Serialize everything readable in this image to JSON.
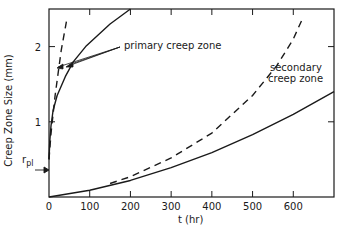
{
  "chart_data": {
    "type": "line",
    "title": "",
    "xlabel": "t (hr)",
    "ylabel": "Creep Zone Size (mm)",
    "xlim": [
      0,
      700
    ],
    "ylim": [
      0,
      2.5
    ],
    "x_ticks": [
      0,
      100,
      200,
      300,
      400,
      500,
      600
    ],
    "y_ticks": [
      1,
      2
    ],
    "grid": false,
    "annotations": [
      {
        "text": "primary creep zone",
        "x": 300,
        "y": 2.05
      },
      {
        "text": "secondary creep zone",
        "x": 640,
        "y": 1.55
      },
      {
        "text": "r_pl",
        "x": 0,
        "y": 0.5,
        "arrow": true
      }
    ],
    "series": [
      {
        "name": "primary creep zone (solid)",
        "style": "solid",
        "x": [
          0,
          2,
          5,
          10,
          20,
          40,
          60,
          90,
          120,
          150,
          180,
          200
        ],
        "y": [
          0.5,
          0.75,
          0.95,
          1.15,
          1.35,
          1.6,
          1.8,
          2.0,
          2.15,
          2.3,
          2.42,
          2.5
        ]
      },
      {
        "name": "primary creep zone (dashed)",
        "style": "dashed",
        "x": [
          0,
          5,
          10,
          15,
          20,
          25,
          30,
          35,
          40,
          45
        ],
        "y": [
          0.5,
          0.85,
          1.1,
          1.35,
          1.55,
          1.75,
          1.95,
          2.1,
          2.25,
          2.4
        ]
      },
      {
        "name": "secondary creep zone (solid)",
        "style": "solid",
        "x": [
          0,
          100,
          200,
          300,
          400,
          500,
          600,
          700
        ],
        "y": [
          0.0,
          0.09,
          0.22,
          0.39,
          0.59,
          0.83,
          1.1,
          1.4
        ]
      },
      {
        "name": "secondary creep zone (dashed)",
        "style": "dashed",
        "x": [
          150,
          200,
          300,
          400,
          500,
          560,
          600,
          625
        ],
        "y": [
          0.18,
          0.27,
          0.52,
          0.85,
          1.35,
          1.75,
          2.1,
          2.4
        ]
      }
    ]
  },
  "labels": {
    "ylabel": "Creep Zone Size (mm)",
    "xlabel": "t (hr)",
    "primary": "primary creep zone",
    "secondary_1": "secondary",
    "secondary_2": "creep zone",
    "rpl_r": "r",
    "rpl_sub": "pl"
  }
}
